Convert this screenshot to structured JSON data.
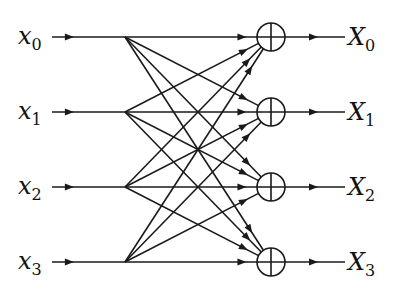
{
  "diagram": {
    "title": "",
    "type": "signal-flow-graph",
    "stroke_color": "#1a1a1a",
    "inputs": [
      {
        "base": "x",
        "sub": "0"
      },
      {
        "base": "x",
        "sub": "1"
      },
      {
        "base": "x",
        "sub": "2"
      },
      {
        "base": "x",
        "sub": "3"
      }
    ],
    "outputs": [
      {
        "base": "X",
        "sub": "0"
      },
      {
        "base": "X",
        "sub": "1"
      },
      {
        "base": "X",
        "sub": "2"
      },
      {
        "base": "X",
        "sub": "3"
      }
    ],
    "adder_symbol": "summing-junction",
    "connections": "every input connects to every adder"
  }
}
